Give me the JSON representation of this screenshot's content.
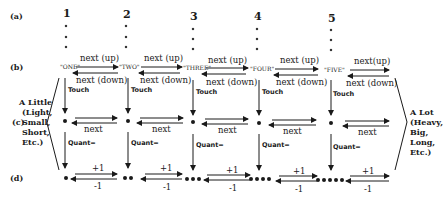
{
  "row_labels": {
    "a": "(a)",
    "b": "(b)",
    "c": "(c)",
    "d": "(d)"
  },
  "columns": [
    {
      "number": "1",
      "word": "\"ONE\"",
      "dots": 1
    },
    {
      "number": "2",
      "word": "\"TWO\"",
      "dots": 2
    },
    {
      "number": "3",
      "word": "\"THREE\"",
      "dots": 3
    },
    {
      "number": "4",
      "word": "\"FOUR\"",
      "dots": 4
    },
    {
      "number": "5",
      "word": "\"FIVE\"",
      "dots": 5
    }
  ],
  "arrows": {
    "next_up": "next (up)",
    "next_up_last": "next(up)",
    "next_down": "next (down)",
    "next": "next",
    "plus_one": "+1",
    "minus_one": "-1",
    "touch": "Touch",
    "quant": "Quant="
  },
  "left_side": {
    "lines": [
      "A Little",
      "(Light,",
      "Small,",
      "Short,",
      "Etc.)"
    ]
  },
  "right_side": {
    "lines": [
      "A Lot",
      "(Heavy,",
      "Big,",
      "Long,",
      "Etc.)"
    ]
  }
}
